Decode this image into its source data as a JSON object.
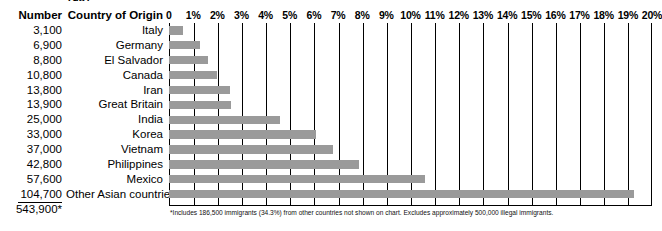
{
  "clipped_title": "1987",
  "header": {
    "number_label": "Number",
    "country_label": "Country of Origin"
  },
  "total": {
    "value": "543,900*"
  },
  "footnote": "*Includes 186,500 immigrants (34.3%) from other countries not shown on chart. Excludes approximately 500,000 illegal immigrants.",
  "colors": {
    "bar": "#9a9a9a",
    "axis": "#000000",
    "background": "#ffffff"
  },
  "chart_data": {
    "type": "bar",
    "orientation": "horizontal",
    "title": "1987",
    "xlabel": "",
    "ylabel": "Country of Origin",
    "xlim": [
      0,
      20
    ],
    "grid": true,
    "legend": null,
    "tick_labels": [
      "0",
      "1%",
      "2%",
      "3%",
      "4%",
      "5%",
      "6%",
      "7%",
      "8%",
      "9%",
      "10%",
      "11%",
      "12%",
      "13%",
      "14%",
      "15%",
      "16%",
      "17%",
      "18%",
      "19%",
      "20%"
    ],
    "tick_values": [
      0,
      1,
      2,
      3,
      4,
      5,
      6,
      7,
      8,
      9,
      10,
      11,
      12,
      13,
      14,
      15,
      16,
      17,
      18,
      19,
      20
    ],
    "categories": [
      "Italy",
      "Germany",
      "El Salvador",
      "Canada",
      "Iran",
      "Great Britain",
      "India",
      "Korea",
      "Vietnam",
      "Philippines",
      "Mexico",
      "Other Asian countries"
    ],
    "counts": [
      "3,100",
      "6,900",
      "8,800",
      "10,800",
      "13,800",
      "13,900",
      "25,000",
      "33,000",
      "37,000",
      "42,800",
      "57,600",
      "104,700"
    ],
    "values": [
      0.57,
      1.27,
      1.62,
      1.99,
      2.54,
      2.56,
      4.6,
      6.07,
      6.8,
      7.87,
      10.59,
      19.25
    ],
    "total_count": "543,900*",
    "rows": [
      {
        "number": "3,100",
        "country": "Italy",
        "percent": 0.57
      },
      {
        "number": "6,900",
        "country": "Germany",
        "percent": 1.27
      },
      {
        "number": "8,800",
        "country": "El Salvador",
        "percent": 1.62
      },
      {
        "number": "10,800",
        "country": "Canada",
        "percent": 1.99
      },
      {
        "number": "13,800",
        "country": "Iran",
        "percent": 2.54
      },
      {
        "number": "13,900",
        "country": "Great Britain",
        "percent": 2.56
      },
      {
        "number": "25,000",
        "country": "India",
        "percent": 4.6
      },
      {
        "number": "33,000",
        "country": "Korea",
        "percent": 6.07
      },
      {
        "number": "37,000",
        "country": "Vietnam",
        "percent": 6.8
      },
      {
        "number": "42,800",
        "country": "Philippines",
        "percent": 7.87
      },
      {
        "number": "57,600",
        "country": "Mexico",
        "percent": 10.59
      },
      {
        "number": "104,700",
        "country": "Other Asian countries",
        "percent": 19.25
      }
    ]
  }
}
